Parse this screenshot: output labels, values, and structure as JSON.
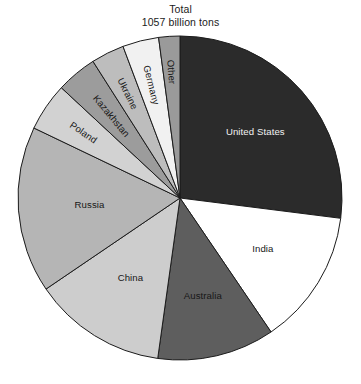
{
  "title": {
    "line1": "Total",
    "line2": "1057 billion tons"
  },
  "chart_data": {
    "type": "pie",
    "title": "Total 1057 billion tons",
    "total": 1057,
    "units": "billion tons",
    "start_angle_deg": 0,
    "direction": "clockwise",
    "legend": "none",
    "labels_placement": "inside-and-radial",
    "categories": [
      "United States",
      "India",
      "Australia",
      "China",
      "Russia",
      "Poland",
      "Kazakhstan",
      "Ukraine",
      "Germany",
      "Other"
    ],
    "values": [
      285,
      143,
      124,
      141,
      176,
      51,
      43,
      35,
      38,
      21
    ],
    "percentages": [
      27.0,
      13.5,
      11.7,
      13.3,
      16.6,
      4.8,
      4.1,
      3.3,
      3.6,
      2.0
    ],
    "slice_colors": [
      "#2b2b2b",
      "#ffffff",
      "#5e5e5e",
      "#cdcdcd",
      "#b5b5b5",
      "#d2d2d2",
      "#9c9c9c",
      "#bdbdbd",
      "#f1f1f1",
      "#9a9a9a"
    ],
    "slice_label_colors": [
      "#f2f2f2",
      "#171717",
      "#171717",
      "#171717",
      "#171717",
      "#171717",
      "#171717",
      "#171717",
      "#171717",
      "#171717"
    ],
    "stroke_color": "#1c1c1c",
    "background": "#ffffff"
  },
  "slices": [
    {
      "name": "United States",
      "label": "United States",
      "value": 285,
      "percent": 27.0,
      "start_deg": 0,
      "end_deg": 97.2,
      "color": "#2b2b2b",
      "label_color": "#f2f2f2",
      "label_radius": 0.62,
      "label_rotated": false
    },
    {
      "name": "India",
      "label": "India",
      "value": 143,
      "percent": 13.5,
      "start_deg": 97.2,
      "end_deg": 145.8,
      "color": "#ffffff",
      "label_color": "#171717",
      "label_radius": 0.6,
      "label_rotated": false
    },
    {
      "name": "Australia",
      "label": "Australia",
      "value": 124,
      "percent": 11.7,
      "start_deg": 145.8,
      "end_deg": 187.9,
      "color": "#5e5e5e",
      "label_color": "#171717",
      "label_radius": 0.62,
      "label_rotated": false
    },
    {
      "name": "China",
      "label": "China",
      "value": 141,
      "percent": 13.3,
      "start_deg": 187.9,
      "end_deg": 235.8,
      "color": "#cdcdcd",
      "label_color": "#171717",
      "label_radius": 0.58,
      "label_rotated": false
    },
    {
      "name": "Russia",
      "label": "Russia",
      "value": 176,
      "percent": 16.6,
      "start_deg": 235.8,
      "end_deg": 295.6,
      "color": "#b5b5b5",
      "label_color": "#171717",
      "label_radius": 0.56,
      "label_rotated": false
    },
    {
      "name": "Poland",
      "label": "Poland",
      "value": 51,
      "percent": 4.8,
      "start_deg": 295.6,
      "end_deg": 312.9,
      "color": "#d2d2d2",
      "label_color": "#171717",
      "label_radius": 0.72,
      "label_rotated": true
    },
    {
      "name": "Kazakhstan",
      "label": "Kazakhstan",
      "value": 43,
      "percent": 4.1,
      "start_deg": 312.9,
      "end_deg": 327.5,
      "color": "#9c9c9c",
      "label_color": "#171717",
      "label_radius": 0.66,
      "label_rotated": true
    },
    {
      "name": "Ukraine",
      "label": "Ukraine",
      "value": 35,
      "percent": 3.3,
      "start_deg": 327.5,
      "end_deg": 339.4,
      "color": "#bdbdbd",
      "label_color": "#171717",
      "label_radius": 0.72,
      "label_rotated": true
    },
    {
      "name": "Germany",
      "label": "Germany",
      "value": 38,
      "percent": 3.6,
      "start_deg": 339.4,
      "end_deg": 352.4,
      "color": "#f1f1f1",
      "label_color": "#171717",
      "label_radius": 0.72,
      "label_rotated": true
    },
    {
      "name": "Other",
      "label": "Other",
      "value": 21,
      "percent": 2.0,
      "start_deg": 352.4,
      "end_deg": 360,
      "color": "#9a9a9a",
      "label_color": "#171717",
      "label_radius": 0.78,
      "label_rotated": true
    }
  ],
  "geometry": {
    "cx": 180,
    "cy": 198,
    "r": 162
  }
}
